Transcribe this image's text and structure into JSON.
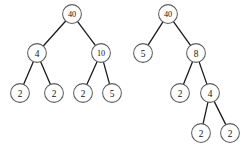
{
  "figure": {
    "background_color": "#ffffff",
    "node_fill_color": "#ffffff",
    "node_stroke_color": "#5d5d5d",
    "edge_color": "#1a1a1a",
    "label_color": "#111111",
    "node_radius": 9.4
  },
  "trees": [
    {
      "name": "left-tree",
      "nodes": [
        {
          "id": "L0",
          "label": "40",
          "cx": 72,
          "cy": 14
        },
        {
          "id": "L1",
          "label": "4",
          "cx": 37,
          "cy": 53
        },
        {
          "id": "L2",
          "label": "10",
          "cx": 101,
          "cy": 53
        },
        {
          "id": "L3",
          "label": "2",
          "cx": 20,
          "cy": 93
        },
        {
          "id": "L4",
          "label": "2",
          "cx": 54,
          "cy": 93
        },
        {
          "id": "L5",
          "label": "2",
          "cx": 83,
          "cy": 93
        },
        {
          "id": "L6",
          "label": "5",
          "cx": 112,
          "cy": 93
        }
      ],
      "edges": [
        {
          "from": "L0",
          "to": "L1"
        },
        {
          "from": "L0",
          "to": "L2"
        },
        {
          "from": "L1",
          "to": "L3"
        },
        {
          "from": "L1",
          "to": "L4"
        },
        {
          "from": "L2",
          "to": "L5"
        },
        {
          "from": "L2",
          "to": "L6"
        }
      ]
    },
    {
      "name": "right-tree",
      "nodes": [
        {
          "id": "R0",
          "label": "40",
          "cx": 168,
          "cy": 14
        },
        {
          "id": "R1",
          "label": "5",
          "cx": 143,
          "cy": 53
        },
        {
          "id": "R2",
          "label": "8",
          "cx": 196,
          "cy": 53
        },
        {
          "id": "R3",
          "label": "2",
          "cx": 180,
          "cy": 93
        },
        {
          "id": "R4",
          "label": "4",
          "cx": 210,
          "cy": 93
        },
        {
          "id": "R5",
          "label": "2",
          "cx": 201,
          "cy": 133
        },
        {
          "id": "R6",
          "label": "2",
          "cx": 230,
          "cy": 133
        }
      ],
      "edges": [
        {
          "from": "R0",
          "to": "R1"
        },
        {
          "from": "R0",
          "to": "R2"
        },
        {
          "from": "R2",
          "to": "R3"
        },
        {
          "from": "R2",
          "to": "R4"
        },
        {
          "from": "R4",
          "to": "R5"
        },
        {
          "from": "R4",
          "to": "R6"
        }
      ]
    }
  ]
}
